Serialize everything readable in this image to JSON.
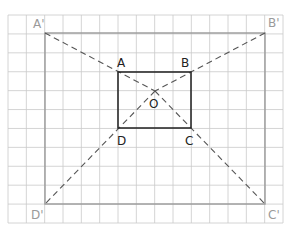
{
  "diagram": {
    "colors": {
      "grid": "#c9c9c9",
      "outer_rect": "#9a9a9a",
      "inner_rect": "#2b2b2b",
      "dashed": "#555555",
      "label_dark": "#222222",
      "label_light": "#9a9a9a"
    },
    "grid": {
      "x0": 8,
      "x1": 283,
      "cols": 15,
      "y0": 15,
      "y1": 223,
      "rows": 11
    },
    "points": {
      "A": {
        "label": "A",
        "x": 118,
        "y": 72
      },
      "B": {
        "label": "B",
        "x": 191,
        "y": 72
      },
      "C": {
        "label": "C",
        "x": 191,
        "y": 128
      },
      "D": {
        "label": "D",
        "x": 118,
        "y": 128
      },
      "O": {
        "label": "O",
        "x": 155,
        "y": 91
      },
      "A1": {
        "label": "A'",
        "x": 45,
        "y": 33
      },
      "B1": {
        "label": "B'",
        "x": 265,
        "y": 33
      },
      "C1": {
        "label": "C'",
        "x": 265,
        "y": 204
      },
      "D1": {
        "label": "D'",
        "x": 45,
        "y": 204
      }
    },
    "labels": {
      "A": "A",
      "B": "B",
      "C": "C",
      "D": "D",
      "O": "O",
      "A1": "A'",
      "B1": "B'",
      "C1": "C'",
      "D1": "D'"
    }
  }
}
